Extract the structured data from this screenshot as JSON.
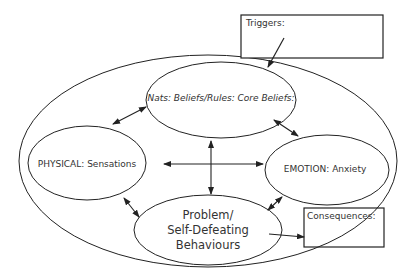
{
  "diagram": {
    "type": "cbt-formulation",
    "boxes": {
      "triggers": {
        "label": "Triggers:"
      },
      "consequences": {
        "label": "Consequences:"
      }
    },
    "nodes": {
      "cognitions": {
        "label": "Nats: Beliefs/Rules: Core Beliefs:"
      },
      "physical": {
        "label": "PHYSICAL: Sensations"
      },
      "emotion": {
        "label": "EMOTION: Anxiety"
      },
      "behaviour": {
        "line1": "Problem/",
        "line2": "Self-Defeating",
        "line3": "Behaviours"
      }
    },
    "connections": [
      {
        "from": "triggers",
        "to": "outer-cycle",
        "type": "one-way"
      },
      {
        "from": "physical",
        "to": "cognitions",
        "type": "two-way"
      },
      {
        "from": "cognitions",
        "to": "emotion",
        "type": "two-way"
      },
      {
        "from": "physical",
        "to": "emotion",
        "type": "two-way"
      },
      {
        "from": "cognitions",
        "to": "behaviour",
        "type": "two-way"
      },
      {
        "from": "physical",
        "to": "behaviour",
        "type": "two-way"
      },
      {
        "from": "emotion",
        "to": "behaviour",
        "type": "two-way"
      },
      {
        "from": "behaviour",
        "to": "consequences",
        "type": "one-way"
      }
    ],
    "colors": {
      "stroke": "#222222",
      "text": "#333333",
      "background": "#ffffff"
    }
  }
}
